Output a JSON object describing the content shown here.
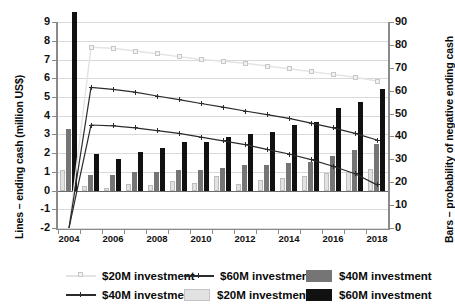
{
  "chart_data": {
    "type": "bar",
    "title": "",
    "xlabel": "",
    "ylabel": "Lines – ending cash (million US$)",
    "y2label": "Bars – probability of negative ending cash",
    "grid": true,
    "legend_position": "bottom",
    "x": [
      2004,
      2005,
      2006,
      2007,
      2008,
      2009,
      2010,
      2011,
      2012,
      2013,
      2014,
      2015,
      2016,
      2017,
      2018
    ],
    "xtick_labels": [
      "2004",
      "2006",
      "2008",
      "2010",
      "2012",
      "2014",
      "2016",
      "2018"
    ],
    "ylim": [
      -2,
      9
    ],
    "ytick_labels": [
      "9",
      "8",
      "7",
      "6",
      "5",
      "4",
      "3",
      "2",
      "1",
      "0",
      "-1",
      "-2"
    ],
    "y2lim": [
      0,
      90
    ],
    "y2tick_labels": [
      "90",
      "80",
      "70",
      "60",
      "50",
      "40",
      "30",
      "20",
      "10",
      "0"
    ],
    "series": [
      {
        "name": "$20M investment",
        "kind": "line",
        "axis": "left",
        "color": "#e3e3e3",
        "marker": "square",
        "values": [
          -2.0,
          7.65,
          7.6,
          7.45,
          7.3,
          7.15,
          7.0,
          6.9,
          6.8,
          6.65,
          6.5,
          6.35,
          6.2,
          6.05,
          5.85
        ]
      },
      {
        "name": "$40M investment",
        "kind": "line",
        "axis": "left",
        "color": "#2b2b2b",
        "marker": "cross",
        "values": [
          -2.0,
          5.5,
          5.4,
          5.25,
          5.05,
          4.85,
          4.65,
          4.45,
          4.25,
          4.05,
          3.85,
          3.6,
          3.35,
          3.05,
          2.7
        ]
      },
      {
        "name": "$60M investment",
        "kind": "line",
        "axis": "left",
        "color": "#2b2b2b",
        "marker": "cross",
        "values": [
          -2.0,
          3.5,
          3.45,
          3.35,
          3.2,
          3.05,
          2.85,
          2.65,
          2.45,
          2.2,
          1.95,
          1.65,
          1.3,
          0.9,
          0.3
        ]
      },
      {
        "name": "$20M investment",
        "kind": "bar",
        "axis": "right",
        "color": "#e2e2e2",
        "values": [
          9.0,
          2.0,
          1.0,
          3.0,
          2.5,
          4.0,
          3.5,
          6.5,
          3.0,
          4.5,
          5.5,
          6.5,
          7.5,
          8.0,
          9.5
        ]
      },
      {
        "name": "$40M investment",
        "kind": "bar",
        "axis": "right",
        "color": "#757575",
        "values": [
          27.0,
          7.0,
          7.0,
          8.0,
          8.0,
          9.0,
          9.0,
          10.0,
          11.0,
          11.0,
          12.0,
          12.5,
          15.0,
          17.5,
          20.5
        ]
      },
      {
        "name": "$60M investment",
        "kind": "bar",
        "axis": "right",
        "color": "#111111",
        "values": [
          78.0,
          16.0,
          14.0,
          17.0,
          18.5,
          21.0,
          21.0,
          23.5,
          24.5,
          25.5,
          28.5,
          30.0,
          36.0,
          38.5,
          44.5
        ]
      }
    ],
    "legend": [
      {
        "label": "$20M investment",
        "key": "line-light-square"
      },
      {
        "label": "$60M investment",
        "key": "line-dark-cross"
      },
      {
        "label": "$40M investment",
        "key": "swatch-gray"
      },
      {
        "label": "$40M investment",
        "key": "line-dark-cross"
      },
      {
        "label": "$20M investment",
        "key": "swatch-light"
      },
      {
        "label": "$60M investment",
        "key": "swatch-black"
      }
    ]
  }
}
